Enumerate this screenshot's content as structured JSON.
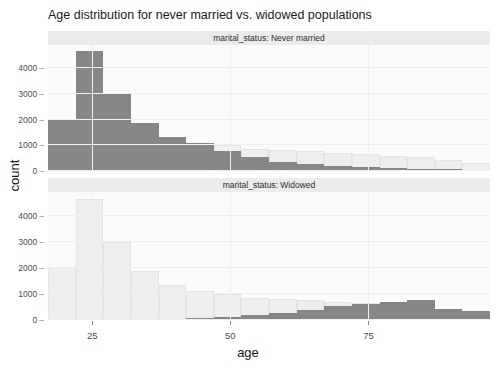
{
  "chart_data": {
    "type": "bar",
    "title": "Age distribution for never married vs. widowed populations",
    "xlabel": "age",
    "ylabel": "count",
    "xlim": [
      17,
      97
    ],
    "ylim": [
      0,
      4900
    ],
    "bin_width": 5,
    "grid": true,
    "legend": "none",
    "facet_variable": "marital_status",
    "x_ticks": [
      25,
      50,
      75,
      100
    ],
    "y_ticks": [
      0,
      1000,
      2000,
      3000,
      4000
    ],
    "bin_starts": [
      17,
      22,
      27,
      32,
      37,
      42,
      47,
      52,
      57,
      62,
      67,
      72,
      77,
      82,
      87,
      92
    ],
    "background_series": {
      "name": "All populations",
      "color": "#eeeeee",
      "values": [
        2020,
        4650,
        3000,
        1860,
        1330,
        1100,
        1010,
        860,
        800,
        760,
        700,
        660,
        600,
        540,
        430,
        330
      ]
    },
    "facets": [
      {
        "id": "never",
        "strip_label": "marital_status: Never married",
        "series_name": "Never married",
        "color": "#868686",
        "values": [
          2020,
          4650,
          3000,
          1860,
          1330,
          1100,
          760,
          560,
          360,
          260,
          200,
          150,
          120,
          90,
          70,
          50
        ]
      },
      {
        "id": "widowed",
        "strip_label": "marital_status: Widowed",
        "series_name": "Widowed",
        "color": "#868686",
        "values": [
          10,
          15,
          20,
          30,
          45,
          70,
          110,
          180,
          280,
          400,
          520,
          620,
          700,
          760,
          430,
          330
        ]
      }
    ]
  }
}
